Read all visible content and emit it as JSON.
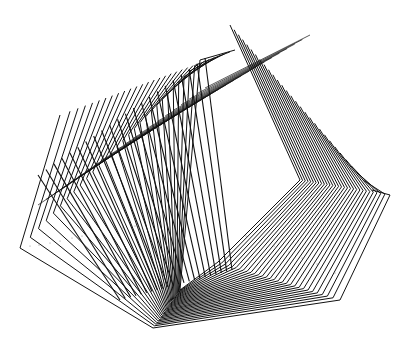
{
  "artwork": {
    "kind": "generative plotter line drawing",
    "background": "#ffffff",
    "stroke": "#111111",
    "stroke_width": 1.0,
    "shape_count": 30,
    "start_shape": [
      [
        20,
        248
      ],
      [
        153,
        328
      ],
      [
        340,
        300
      ],
      [
        390,
        195
      ],
      [
        372,
        190
      ]
    ],
    "end_shape": [
      [
        200,
        60
      ],
      [
        180,
        290
      ],
      [
        218,
        262
      ],
      [
        300,
        180
      ],
      [
        230,
        25
      ]
    ],
    "outer_left_arm": [
      [
        20,
        248
      ],
      [
        60,
        115
      ]
    ],
    "spike_fan": {
      "count": 22,
      "base_start": [
        60,
        185
      ],
      "base_end": [
        235,
        50
      ],
      "tip_start": [
        38,
        175
      ],
      "tip_end": [
        205,
        58
      ]
    },
    "peak": [
      230,
      25
    ],
    "dots": [
      [
        30,
        246
      ],
      [
        39,
        245
      ],
      [
        50,
        243
      ],
      [
        60,
        241
      ],
      [
        72,
        238
      ],
      [
        82,
        236
      ],
      [
        102,
        232
      ],
      [
        122,
        228
      ],
      [
        135,
        226
      ],
      [
        246,
        236
      ],
      [
        260,
        241
      ],
      [
        274,
        246
      ],
      [
        289,
        252
      ],
      [
        302,
        258
      ],
      [
        317,
        264
      ],
      [
        325,
        270
      ],
      [
        335,
        273
      ]
    ]
  }
}
